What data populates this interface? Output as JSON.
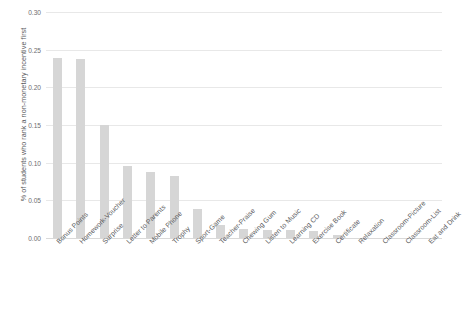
{
  "chart_data": {
    "type": "bar",
    "title": "",
    "subtitle": "",
    "xlabel": "",
    "ylabel": "% of students who rank a non-monetary incentive first",
    "ylim": [
      0.0,
      0.3
    ],
    "ytick_labels": [
      "0.00",
      "0.05",
      "0.10",
      "0.15",
      "0.20",
      "0.25",
      "0.30"
    ],
    "ytick_values": [
      0.0,
      0.05,
      0.1,
      0.15,
      0.2,
      0.25,
      0.3
    ],
    "grid": true,
    "legend": "none",
    "bar_color": "#d6d6d6",
    "background_color": "#ffffff",
    "categories": [
      "Bonus Points",
      "Homework-Voucher",
      "Surprise",
      "Letter to Parents",
      "Mobile Phone",
      "Trophy",
      "Sport-Game",
      "Teacher-Praise",
      "Chewing Gum",
      "Listen to Music",
      "Learning CD",
      "Exercise Book",
      "Certificate",
      "Relaxation",
      "Classroom-Picture",
      "Classroom-List",
      "Eat and Drink"
    ],
    "values": [
      0.239,
      0.237,
      0.15,
      0.095,
      0.087,
      0.082,
      0.038,
      0.017,
      0.012,
      0.011,
      0.01,
      0.009,
      0.004,
      0.0,
      0.0,
      0.0,
      0.0
    ]
  }
}
